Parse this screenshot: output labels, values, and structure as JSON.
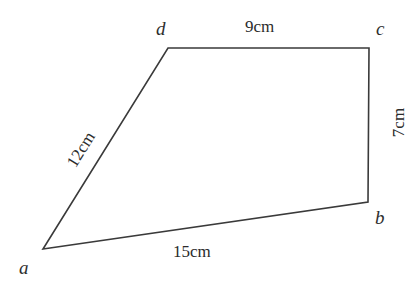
{
  "figure": {
    "background_color": "#ffffff",
    "stroke_color": "#3a3a3a",
    "text_color": "#2b2b2b",
    "vertices": [
      {
        "name": "a",
        "label": "a",
        "x": 43,
        "y": 249
      },
      {
        "name": "b",
        "label": "b",
        "x": 368,
        "y": 202
      },
      {
        "name": "c",
        "label": "c",
        "x": 369,
        "y": 48
      },
      {
        "name": "d",
        "label": "d",
        "x": 168,
        "y": 48
      }
    ],
    "sides": [
      {
        "name": "ab",
        "from": "a",
        "to": "b",
        "label": "15cm",
        "value": 15,
        "unit": "cm"
      },
      {
        "name": "bc",
        "from": "b",
        "to": "c",
        "label": "7cm",
        "value": 7,
        "unit": "cm"
      },
      {
        "name": "dc",
        "from": "d",
        "to": "c",
        "label": "9cm",
        "value": 9,
        "unit": "cm"
      },
      {
        "name": "ad",
        "from": "a",
        "to": "d",
        "label": "12cm",
        "value": 12,
        "unit": "cm"
      }
    ]
  },
  "chart_data": {
    "type": "diagram",
    "shape": "quadrilateral",
    "title": "",
    "vertex_labels": [
      "a",
      "b",
      "c",
      "d"
    ],
    "side_labels": [
      "15cm",
      "7cm",
      "9cm",
      "12cm"
    ],
    "side_values": [
      15,
      7,
      9,
      12
    ],
    "unit": "cm",
    "polygon_points": "43,249 368,202 369,48 168,48"
  }
}
